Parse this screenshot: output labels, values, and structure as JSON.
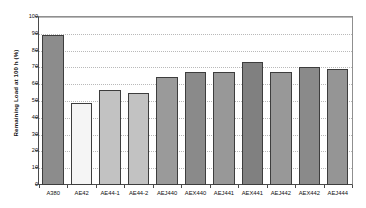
{
  "chart_data": {
    "type": "bar",
    "title": "",
    "xlabel": "",
    "ylabel": "Remaining Load at 100 h (%)",
    "ylim": [
      0,
      100
    ],
    "ytick_step": 10,
    "yticks": [
      0,
      10,
      20,
      30,
      40,
      50,
      60,
      70,
      80,
      90,
      100
    ],
    "ytick_labels": [
      "0",
      "10",
      "20",
      "30",
      "40",
      "50",
      "60",
      "70",
      "80",
      "90",
      "100"
    ],
    "grid": "horizontal-dotted",
    "legend": "none",
    "categories": [
      "A380",
      "AE42",
      "AE44-1",
      "AE44-2",
      "AEJ440",
      "AEX440",
      "AEJ441",
      "AEX441",
      "AEJ442",
      "AEX442",
      "AEJ444"
    ],
    "values": [
      89.5,
      49.0,
      56.5,
      55.0,
      64.0,
      67.5,
      67.0,
      73.0,
      67.5,
      70.5,
      69.0
    ],
    "bar_colors": [
      "#8c8c8c",
      "#f5f5f5",
      "#c2c2c2",
      "#c2c2c2",
      "#9a9a9a",
      "#8a8a8a",
      "#989898",
      "#808080",
      "#989898",
      "#8a8a8a",
      "#959595"
    ],
    "bar_edge_color": "#3d3d3d",
    "axis_color": "#4a4a4a",
    "gridline_color": "#b9b9b9",
    "background_color": "#ffffff",
    "text_color": "#111111"
  }
}
